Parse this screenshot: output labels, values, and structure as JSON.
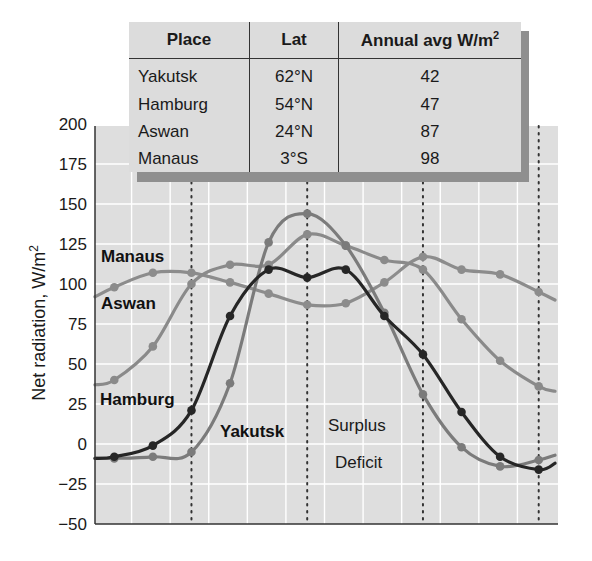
{
  "chart_data": {
    "type": "line",
    "title": "",
    "xlabel": "",
    "ylabel": "Net radiation, W/m²",
    "ylim": [
      -50,
      200
    ],
    "yticks": [
      200,
      175,
      150,
      125,
      100,
      75,
      50,
      25,
      0,
      -25,
      -50
    ],
    "grid": true,
    "x": [
      1,
      2,
      3,
      4,
      5,
      6,
      7,
      8,
      9,
      10,
      11,
      12
    ],
    "x_note": "monthly values (x tick labels not shown)",
    "dotted_vertical_lines_at_month_boundary": [
      2.5,
      5.5,
      8.5,
      11.5
    ],
    "series": [
      {
        "name": "Yakutsk",
        "color": "#7b7b7b",
        "values": [
          -9,
          -8,
          -5,
          38,
          126,
          144,
          124,
          82,
          31,
          -2,
          -14,
          -10
        ]
      },
      {
        "name": "Hamburg",
        "color": "#262626",
        "values": [
          -8,
          -1,
          21,
          80,
          109,
          104,
          109,
          80,
          56,
          20,
          -8,
          -16
        ]
      },
      {
        "name": "Aswan",
        "color": "#8a8a8a",
        "values": [
          40,
          61,
          100,
          112,
          112,
          131,
          124,
          115,
          109,
          78,
          52,
          36
        ]
      },
      {
        "name": "Manaus",
        "color": "#8c8c8c",
        "values": [
          98,
          107,
          107,
          101,
          94,
          87,
          88,
          101,
          117,
          109,
          106,
          95
        ]
      }
    ],
    "annotations": [
      {
        "text": "Manaus",
        "near_value": 117
      },
      {
        "text": "Aswan",
        "near_value": 90
      },
      {
        "text": "Hamburg",
        "near_value": 28
      },
      {
        "text": "Yakutsk",
        "near_value": 12
      },
      {
        "text": "Surplus",
        "near_value": 12
      },
      {
        "text": "Deficit",
        "near_value": -12
      }
    ]
  },
  "table": {
    "headers": {
      "place": "Place",
      "lat": "Lat",
      "avg": "Annual avg W/m",
      "avg_sup": "2"
    },
    "rows": [
      {
        "place": "Yakutsk",
        "lat": "62°N",
        "avg": "42"
      },
      {
        "place": "Hamburg",
        "lat": "54°N",
        "avg": "47"
      },
      {
        "place": "Aswan",
        "lat": "24°N",
        "avg": "87"
      },
      {
        "place": "Manaus",
        "lat": "3°S",
        "avg": "98"
      }
    ]
  },
  "labels": {
    "ylabel_main": "Net radiation, W/m",
    "ylabel_sup": "2",
    "manaus": "Manaus",
    "aswan": "Aswan",
    "hamburg": "Hamburg",
    "yakutsk": "Yakutsk",
    "surplus": "Surplus",
    "deficit": "Deficit"
  }
}
